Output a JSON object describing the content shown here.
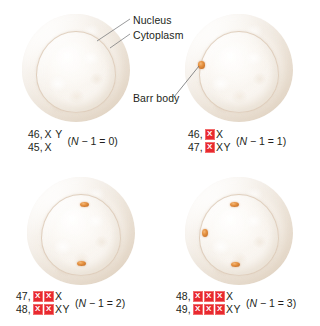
{
  "figure": {
    "callouts": [
      {
        "id": "nucleus",
        "label": "Nucleus"
      },
      {
        "id": "cytoplasm",
        "label": "Cytoplasm"
      },
      {
        "id": "barr_body",
        "label": "Barr body"
      }
    ],
    "barr_body_color": "#e5913f",
    "inactive_x_chip_color": "#e8292f",
    "inactive_x_chip_text_color": "#ffffff",
    "cell_color": "#f2ebe1"
  },
  "panels": [
    {
      "id": "top-left",
      "barr_body_count": 0,
      "caption": {
        "rows": [
          {
            "count": "46,",
            "inactive_x": 0,
            "active": "X Y"
          },
          {
            "count": "45,",
            "inactive_x": 0,
            "active": "X"
          }
        ],
        "formula_prefix": "(",
        "formula_n": "N",
        "formula_body": " − 1 = 0)",
        "formula_full": "(N − 1 = 0)"
      }
    },
    {
      "id": "top-right",
      "barr_body_count": 1,
      "caption": {
        "rows": [
          {
            "count": "46,",
            "inactive_x": 1,
            "active": "X"
          },
          {
            "count": "47,",
            "inactive_x": 1,
            "active": "XY"
          }
        ],
        "formula_prefix": "(",
        "formula_n": "N",
        "formula_body": " − 1 = 1)",
        "formula_full": "(N − 1 = 1)"
      }
    },
    {
      "id": "bottom-left",
      "barr_body_count": 2,
      "caption": {
        "rows": [
          {
            "count": "47,",
            "inactive_x": 2,
            "active": "X"
          },
          {
            "count": "48,",
            "inactive_x": 2,
            "active": "XY"
          }
        ],
        "formula_prefix": "(",
        "formula_n": "N",
        "formula_body": " − 1 = 2)",
        "formula_full": "(N − 1 = 2)"
      }
    },
    {
      "id": "bottom-right",
      "barr_body_count": 3,
      "caption": {
        "rows": [
          {
            "count": "48,",
            "inactive_x": 3,
            "active": "X"
          },
          {
            "count": "49,",
            "inactive_x": 3,
            "active": "XY"
          }
        ],
        "formula_prefix": "(",
        "formula_n": "N",
        "formula_body": " − 1 = 3)",
        "formula_full": "(N − 1 = 3)"
      }
    }
  ],
  "chip_glyph": "X"
}
